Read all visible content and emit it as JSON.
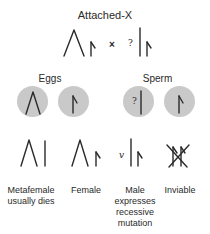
{
  "diagram": {
    "title": "Attached-X",
    "cross_symbol": "×",
    "unknown_marker": "?",
    "recessive_marker": "v",
    "gametes": {
      "eggs_label": "Eggs",
      "sperm_label": "Sperm",
      "eggs": [
        {
          "chromosome": "attached-X (inverted V)"
        },
        {
          "chromosome": "Y (hooked)"
        }
      ],
      "sperm": [
        {
          "chromosome": "X with unknown allele",
          "marker": "?"
        },
        {
          "chromosome": "Y (hooked)"
        }
      ]
    },
    "offspring": [
      {
        "genotype": "attached-X + X",
        "caption_line1": "Metafemale",
        "caption_line2": "usually dies"
      },
      {
        "genotype": "attached-X + Y",
        "caption_line1": "Female",
        "caption_line2": ""
      },
      {
        "genotype": "X + Y",
        "caption_line1": "Male",
        "caption_line2": "expresses",
        "caption_line3": "recessive",
        "caption_line4": "mutation"
      },
      {
        "genotype": "Y + Y",
        "caption_line1": "Inviable",
        "caption_line2": ""
      }
    ],
    "colors": {
      "ink": "#2a2a2a",
      "gamete_circle": "#c9c9c9",
      "background": "#ffffff"
    }
  }
}
